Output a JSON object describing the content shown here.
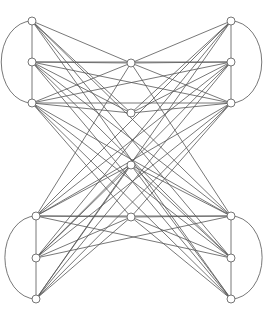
{
  "graph": {
    "node_radius": 4,
    "nodes": [
      {
        "id": "LT1",
        "x": 32,
        "y": 21
      },
      {
        "id": "LT2",
        "x": 32,
        "y": 62
      },
      {
        "id": "LT3",
        "x": 32,
        "y": 103
      },
      {
        "id": "RT1",
        "x": 231,
        "y": 21
      },
      {
        "id": "RT2",
        "x": 231,
        "y": 62
      },
      {
        "id": "RT3",
        "x": 231,
        "y": 103
      },
      {
        "id": "C1",
        "x": 131,
        "y": 63
      },
      {
        "id": "C2",
        "x": 131,
        "y": 113
      },
      {
        "id": "C3",
        "x": 131,
        "y": 165
      },
      {
        "id": "C4",
        "x": 131,
        "y": 217
      },
      {
        "id": "LB1",
        "x": 36,
        "y": 216
      },
      {
        "id": "LB2",
        "x": 36,
        "y": 258
      },
      {
        "id": "LB3",
        "x": 36,
        "y": 299
      },
      {
        "id": "RB1",
        "x": 231,
        "y": 216
      },
      {
        "id": "RB2",
        "x": 231,
        "y": 258
      },
      {
        "id": "RB3",
        "x": 231,
        "y": 299
      }
    ],
    "arcs": [
      {
        "from": "LT1",
        "to": "LT3",
        "side": "left"
      },
      {
        "from": "RT1",
        "to": "RT3",
        "side": "right"
      },
      {
        "from": "LB1",
        "to": "LB3",
        "side": "left"
      },
      {
        "from": "RB1",
        "to": "RB3",
        "side": "right"
      }
    ],
    "edges": [
      [
        "LT1",
        "LT2"
      ],
      [
        "LT2",
        "LT3"
      ],
      [
        "RT1",
        "RT2"
      ],
      [
        "RT2",
        "RT3"
      ],
      [
        "LB1",
        "LB2"
      ],
      [
        "LB2",
        "LB3"
      ],
      [
        "RB1",
        "RB2"
      ],
      [
        "RB2",
        "RB3"
      ],
      [
        "LT1",
        "C1"
      ],
      [
        "LT2",
        "C1"
      ],
      [
        "LT3",
        "C1"
      ],
      [
        "RT1",
        "C1"
      ],
      [
        "RT2",
        "C1"
      ],
      [
        "RT3",
        "C1"
      ],
      [
        "LT1",
        "C2"
      ],
      [
        "LT2",
        "C2"
      ],
      [
        "LT3",
        "C2"
      ],
      [
        "RT1",
        "C2"
      ],
      [
        "RT2",
        "C2"
      ],
      [
        "RT3",
        "C2"
      ],
      [
        "LB1",
        "C3"
      ],
      [
        "LB2",
        "C3"
      ],
      [
        "LB3",
        "C3"
      ],
      [
        "RB1",
        "C3"
      ],
      [
        "RB2",
        "C3"
      ],
      [
        "RB3",
        "C3"
      ],
      [
        "LB1",
        "C4"
      ],
      [
        "LB2",
        "C4"
      ],
      [
        "LB3",
        "C4"
      ],
      [
        "RB1",
        "C4"
      ],
      [
        "RB2",
        "C4"
      ],
      [
        "RB3",
        "C4"
      ],
      [
        "LT2",
        "RT3"
      ],
      [
        "LT3",
        "RT2"
      ],
      [
        "LT2",
        "RT2"
      ],
      [
        "LT3",
        "RT3"
      ],
      [
        "LB1",
        "RB1"
      ],
      [
        "LB1",
        "RB2"
      ],
      [
        "LB2",
        "RB1"
      ],
      [
        "LT1",
        "RB1"
      ],
      [
        "LT1",
        "RB2"
      ],
      [
        "LT1",
        "RB3"
      ],
      [
        "LT2",
        "RB1"
      ],
      [
        "LT2",
        "RB2"
      ],
      [
        "LT2",
        "RB3"
      ],
      [
        "LT3",
        "RB1"
      ],
      [
        "LT3",
        "RB2"
      ],
      [
        "LT3",
        "RB3"
      ],
      [
        "RT1",
        "LB1"
      ],
      [
        "RT1",
        "LB2"
      ],
      [
        "RT1",
        "LB3"
      ],
      [
        "RT2",
        "LB1"
      ],
      [
        "RT2",
        "LB2"
      ],
      [
        "RT2",
        "LB3"
      ],
      [
        "RT3",
        "LB1"
      ],
      [
        "RT3",
        "LB2"
      ],
      [
        "RT3",
        "LB3"
      ],
      [
        "C1",
        "LB1"
      ],
      [
        "C1",
        "RB1"
      ],
      [
        "C4",
        "LT3"
      ],
      [
        "C4",
        "RT3"
      ]
    ]
  }
}
